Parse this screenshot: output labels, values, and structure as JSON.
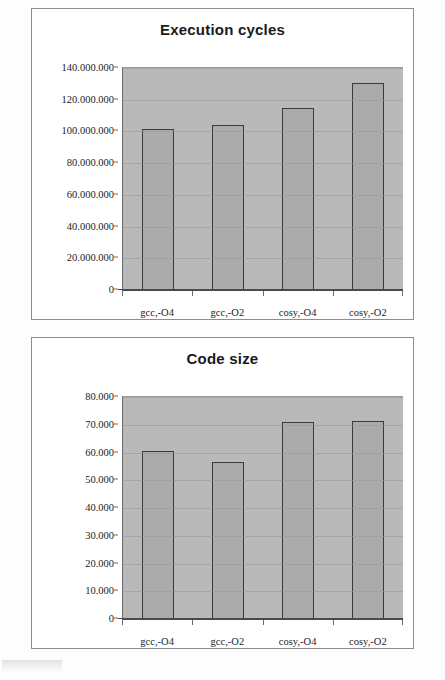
{
  "page": {
    "background_color": "#fdfdfd",
    "card_border_color": "#8d8d8d",
    "plot_background_color": "#b9b9b9",
    "bar_fill_color": "#ababab",
    "bar_border_color": "#3a3a3a"
  },
  "chart_data": [
    {
      "type": "bar",
      "title": "Execution cycles",
      "xlabel": "",
      "ylabel": "",
      "categories": [
        "gcc,-O4",
        "gcc,-O2",
        "cosy,-O4",
        "cosy,-O2"
      ],
      "values": [
        101500000,
        104000000,
        115000000,
        130500000
      ],
      "ylim": [
        0,
        140000000
      ],
      "ytick_values": [
        0,
        20000000,
        40000000,
        60000000,
        80000000,
        100000000,
        120000000,
        140000000
      ],
      "ytick_labels": [
        "0",
        "20.000.000",
        "40.000.000",
        "60.000.000",
        "80.000.000",
        "100.000.000",
        "120.000.000",
        "140.000.000"
      ],
      "grid": true,
      "legend": false
    },
    {
      "type": "bar",
      "title": "Code size",
      "xlabel": "",
      "ylabel": "",
      "categories": [
        "gcc,-O4",
        "gcc,-O2",
        "cosy,-O4",
        "cosy,-O2"
      ],
      "values": [
        60500,
        56500,
        71000,
        71500
      ],
      "ylim": [
        0,
        80000
      ],
      "ytick_values": [
        0,
        10000,
        20000,
        30000,
        40000,
        50000,
        60000,
        70000,
        80000
      ],
      "ytick_labels": [
        "0",
        "10.000",
        "20.000",
        "30.000",
        "40.000",
        "50.000",
        "60.000",
        "70.000",
        "80.000"
      ],
      "grid": true,
      "legend": false
    }
  ]
}
